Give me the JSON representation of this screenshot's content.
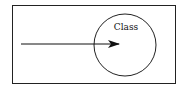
{
  "diagram": {
    "circle_label": "Class",
    "elements": [
      "rectangle-boundary",
      "circle-class",
      "arrow-into-class"
    ],
    "stroke_color": "#111111",
    "background": "#ffffff"
  }
}
